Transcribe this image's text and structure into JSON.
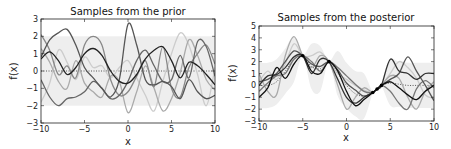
{
  "chart_data": [
    {
      "type": "line",
      "title": "Samples from the prior",
      "xlabel": "x",
      "ylabel": "f(x)",
      "xlim": [
        -10,
        10
      ],
      "ylim": [
        -3,
        3
      ],
      "xticks": [
        -10,
        -5,
        0,
        5,
        10
      ],
      "yticks": [
        -3,
        -2,
        -1,
        0,
        1,
        2,
        3
      ],
      "xtick_labels": [
        "−10",
        "−5",
        "0",
        "5",
        "10"
      ],
      "ytick_labels": [
        "−3",
        "−2",
        "−1",
        "0",
        "1",
        "2",
        "3"
      ],
      "grid": false,
      "legend": null,
      "confidence_band": {
        "lower": -2,
        "upper": 2,
        "color": "#eeeeee"
      },
      "mean_line": {
        "style": "dotted",
        "value": 0
      },
      "x": [
        -10,
        -9,
        -8,
        -7,
        -6,
        -5,
        -4,
        -3,
        -2,
        -1,
        0,
        1,
        2,
        3,
        4,
        5,
        6,
        7,
        8,
        9,
        10
      ],
      "series": [
        {
          "name": "sample 1",
          "color": "#222222",
          "values": [
            0.7,
            1.1,
            0.6,
            -0.2,
            0.2,
            1.0,
            1.3,
            0.9,
            0.0,
            -0.6,
            -0.7,
            -0.2,
            0.7,
            1.2,
            1.4,
            0.6,
            -0.4,
            0.5,
            0.3,
            -0.2,
            -0.8
          ]
        },
        {
          "name": "sample 2",
          "color": "#555555",
          "values": [
            0.8,
            1.8,
            2.2,
            2.4,
            1.5,
            0.2,
            -0.4,
            -1.0,
            -1.5,
            -0.5,
            2.7,
            1.5,
            -0.5,
            -0.8,
            -0.6,
            -0.9,
            -1.6,
            -0.5,
            -1.2,
            -1.6,
            -1.4
          ]
        },
        {
          "name": "sample 3",
          "color": "#666666",
          "values": [
            -0.5,
            -1.5,
            -2.0,
            -1.6,
            -1.5,
            -1.2,
            -0.6,
            -1.0,
            -1.6,
            -1.4,
            -0.6,
            0.6,
            1.2,
            0.3,
            -0.6,
            -0.5,
            0.9,
            -0.4,
            1.7,
            1.4,
            -0.3
          ]
        },
        {
          "name": "sample 4",
          "color": "#888888",
          "values": [
            2.1,
            1.2,
            -0.2,
            0.3,
            -0.4,
            1.5,
            2.0,
            1.5,
            -0.5,
            -1.4,
            -1.2,
            -0.3,
            0.6,
            -0.9,
            1.4,
            -1.0,
            -1.5,
            0.2,
            1.0,
            1.5,
            0.4
          ]
        },
        {
          "name": "sample 5",
          "color": "#aaaaaa",
          "values": [
            1.3,
            0.5,
            -0.6,
            -1.0,
            0.6,
            -0.7,
            -1.2,
            -1.5,
            -0.3,
            -0.6,
            -2.4,
            -1.2,
            0.3,
            -1.0,
            -2.3,
            -1.6,
            -0.1,
            1.8,
            0.9,
            -0.5,
            -1.1
          ]
        },
        {
          "name": "sample 6",
          "color": "#cccccc",
          "values": [
            -1.8,
            -0.7,
            1.2,
            0.5,
            -0.5,
            0.8,
            0.2,
            0.3,
            -0.4,
            0.2,
            0.6,
            -0.4,
            -1.4,
            -2.3,
            -0.6,
            1.0,
            2.2,
            1.5,
            -0.2,
            -2.0,
            0.2
          ]
        }
      ]
    },
    {
      "type": "line",
      "title": "Samples from the posterior",
      "xlabel": "x",
      "ylabel": "f(x)",
      "xlim": [
        -10,
        10
      ],
      "ylim": [
        -3,
        5
      ],
      "xticks": [
        -10,
        -5,
        0,
        5,
        10
      ],
      "yticks": [
        -3,
        -2,
        -1,
        0,
        1,
        2,
        3,
        4,
        5
      ],
      "xtick_labels": [
        "−10",
        "−5",
        "0",
        "5",
        "10"
      ],
      "ytick_labels": [
        "−3",
        "−2",
        "−1",
        "0",
        "1",
        "2",
        "3",
        "4",
        "5"
      ],
      "grid": false,
      "legend": null,
      "confidence_band": {
        "color": "#eeeeee"
      },
      "observations": {
        "x": [
          -5,
          -2,
          3,
          3.5,
          4
        ],
        "y": [
          2.5,
          2.0,
          -0.6,
          -0.3,
          0.0
        ]
      },
      "mean_line": {
        "style": "dotted"
      },
      "x": [
        -10,
        -9,
        -8,
        -7,
        -6,
        -5,
        -4,
        -3,
        -2,
        -1,
        0,
        1,
        2,
        3,
        3.5,
        4,
        5,
        6,
        7,
        8,
        9,
        10
      ],
      "mean": [
        0,
        0.0,
        0.3,
        1.2,
        2.2,
        2.5,
        1.6,
        1.4,
        2.0,
        1.0,
        0.0,
        -0.7,
        -0.9,
        -0.6,
        -0.3,
        0.0,
        0.2,
        0.1,
        0.0,
        0.0,
        0.0,
        0
      ],
      "series": [
        {
          "name": "sample 1",
          "color": "#111111",
          "values": [
            -1.0,
            -0.2,
            1.5,
            0.6,
            1.8,
            2.5,
            1.2,
            1.0,
            2.0,
            1.2,
            -0.5,
            -1.7,
            -1.2,
            -0.6,
            -0.3,
            0.0,
            0.3,
            -0.2,
            -0.8,
            -1.2,
            -0.5,
            0.0
          ]
        },
        {
          "name": "sample 2",
          "color": "#333333",
          "values": [
            0.0,
            0.8,
            0.9,
            1.5,
            2.4,
            2.5,
            1.0,
            2.2,
            2.0,
            0.5,
            -1.0,
            -1.5,
            -1.0,
            -0.6,
            -0.3,
            0.0,
            2.2,
            1.2,
            1.0,
            0.5,
            1.0,
            1.0
          ]
        },
        {
          "name": "sample 3",
          "color": "#555555",
          "values": [
            0.3,
            0.5,
            1.0,
            2.0,
            2.9,
            2.5,
            1.8,
            1.6,
            2.0,
            1.3,
            0.2,
            -0.4,
            -0.9,
            -0.6,
            -0.3,
            0.0,
            0.5,
            1.0,
            2.4,
            1.2,
            0.0,
            -1.3
          ]
        },
        {
          "name": "sample 4",
          "color": "#777777",
          "values": [
            -0.5,
            0.2,
            0.8,
            1.0,
            2.2,
            2.5,
            2.0,
            1.2,
            2.0,
            1.5,
            0.8,
            0.1,
            -0.5,
            -0.6,
            -0.3,
            0.0,
            -0.5,
            -1.5,
            -2.0,
            -0.3,
            0.4,
            -0.2
          ]
        },
        {
          "name": "sample 5",
          "color": "#aaaaaa",
          "values": [
            1.0,
            -0.5,
            -0.8,
            2.5,
            4.1,
            2.5,
            1.5,
            2.5,
            2.0,
            0.0,
            -2.0,
            -1.0,
            -0.2,
            -0.6,
            -0.3,
            0.0,
            0.8,
            0.6,
            -1.0,
            -2.0,
            -0.5,
            0.3
          ]
        },
        {
          "name": "sample 6",
          "color": "#cccccc",
          "values": [
            0.3,
            1.2,
            0.5,
            1.8,
            3.5,
            2.5,
            2.5,
            2.8,
            2.0,
            1.0,
            0.5,
            0.0,
            -0.4,
            -0.6,
            -0.3,
            0.0,
            1.0,
            2.0,
            1.5,
            0.6,
            -0.8,
            -1.1
          ]
        }
      ]
    }
  ],
  "charts": [
    {
      "title": "Samples from the prior",
      "xlabel": "x",
      "ylabel": "f(x)"
    },
    {
      "title": "Samples from the posterior",
      "xlabel": "x",
      "ylabel": "f(x)"
    }
  ]
}
